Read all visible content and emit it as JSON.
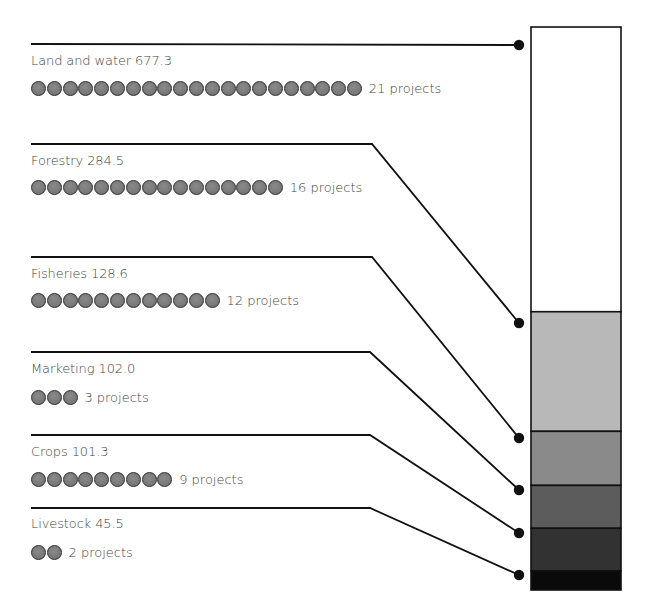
{
  "chart_data": {
    "type": "bar",
    "subtype": "stacked-single-bar-with-callouts",
    "title": "",
    "xlabel": "",
    "ylabel": "",
    "categories": [
      "Land and water",
      "Forestry",
      "Fisheries",
      "Marketing",
      "Crops",
      "Livestock"
    ],
    "values": [
      677.3,
      284.5,
      128.6,
      102.0,
      101.3,
      45.5
    ],
    "projects": [
      21,
      16,
      12,
      3,
      9,
      2
    ],
    "series": [
      {
        "name": "Amount",
        "values": [
          677.3,
          284.5,
          128.6,
          102.0,
          101.3,
          45.5
        ]
      },
      {
        "name": "Projects",
        "values": [
          21,
          16,
          12,
          3,
          9,
          2
        ]
      }
    ],
    "segment_colors": [
      "#ffffff",
      "#b8b8b8",
      "#8a8a8a",
      "#5c5c5c",
      "#323232",
      "#0a0a0a"
    ],
    "grid": false,
    "legend": "none"
  },
  "items": [
    {
      "name": "Land and water",
      "value": "677.3",
      "label": "Land and water 677.3",
      "projects": 21,
      "projects_label": "21 projects"
    },
    {
      "name": "Forestry",
      "value": "284.5",
      "label": "Forestry 284.5",
      "projects": 16,
      "projects_label": "16 projects"
    },
    {
      "name": "Fisheries",
      "value": "128.6",
      "label": "Fisheries 128.6",
      "projects": 12,
      "projects_label": "12 projects"
    },
    {
      "name": "Marketing",
      "value": "102.0",
      "label": "Marketing 102.0",
      "projects": 3,
      "projects_label": "3 projects"
    },
    {
      "name": "Crops",
      "value": "101.3",
      "label": "Crops 101.3",
      "projects": 9,
      "projects_label": "9 projects"
    },
    {
      "name": "Livestock",
      "value": "45.5",
      "label": "Livestock 45.5",
      "projects": 2,
      "projects_label": "2 projects"
    }
  ],
  "colors": {
    "line": "#111111",
    "bar_outline": "#111111",
    "dot_fill": "#7a7a7a"
  }
}
